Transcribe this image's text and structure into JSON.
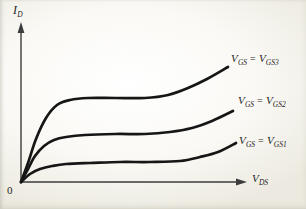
{
  "theme": {
    "background": "#faf9f5",
    "ink": "#161616",
    "axis": "#3c3c3c",
    "text": "#1e1e1e"
  },
  "figure": {
    "y_axis": {
      "symbol": "I",
      "subscript": "D"
    },
    "x_axis": {
      "symbol": "V",
      "subscript": "DS"
    },
    "origin_label": "0",
    "curves": [
      {
        "id": "vgs3",
        "label": {
          "lhs": "V",
          "lhs_sub": "GS",
          "eq": "=",
          "rhs": "V",
          "rhs_sub": "GS3"
        },
        "points": [
          [
            21,
            182
          ],
          [
            28,
            163
          ],
          [
            36,
            139
          ],
          [
            46,
            118
          ],
          [
            57,
            105
          ],
          [
            70,
            100
          ],
          [
            88,
            98
          ],
          [
            115,
            98
          ],
          [
            145,
            98
          ],
          [
            168,
            95
          ],
          [
            188,
            88
          ],
          [
            207,
            79
          ],
          [
            228,
            67
          ]
        ]
      },
      {
        "id": "vgs2",
        "label": {
          "lhs": "V",
          "lhs_sub": "GS",
          "eq": "=",
          "rhs": "V",
          "rhs_sub": "GS2"
        },
        "points": [
          [
            21,
            182
          ],
          [
            28,
            169
          ],
          [
            35,
            156
          ],
          [
            44,
            146
          ],
          [
            54,
            140
          ],
          [
            66,
            137
          ],
          [
            85,
            135
          ],
          [
            115,
            134
          ],
          [
            145,
            134
          ],
          [
            170,
            132
          ],
          [
            192,
            128
          ],
          [
            212,
            121
          ],
          [
            233,
            111
          ]
        ]
      },
      {
        "id": "vgs1",
        "label": {
          "lhs": "V",
          "lhs_sub": "GS",
          "eq": "=",
          "rhs": "V",
          "rhs_sub": "GS1"
        },
        "points": [
          [
            21,
            182
          ],
          [
            30,
            174
          ],
          [
            40,
            169
          ],
          [
            52,
            166
          ],
          [
            66,
            164
          ],
          [
            90,
            163
          ],
          [
            120,
            162
          ],
          [
            150,
            162
          ],
          [
            180,
            161
          ],
          [
            200,
            157
          ],
          [
            218,
            152
          ],
          [
            236,
            143
          ]
        ]
      }
    ]
  }
}
